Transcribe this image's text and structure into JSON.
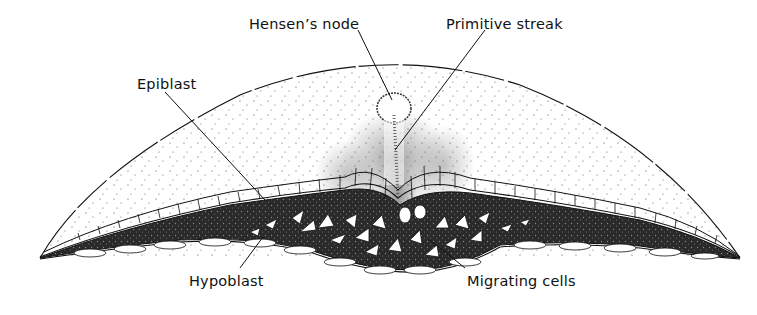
{
  "diagram": {
    "colors": {
      "ink": "#111111",
      "background": "#ffffff",
      "stipple": "#333333"
    },
    "labels": [
      {
        "id": "hensens-node",
        "text": "Hensen’s node",
        "x": 249,
        "y": 16
      },
      {
        "id": "primitive-streak",
        "text": "Primitive streak",
        "x": 446,
        "y": 16
      },
      {
        "id": "epiblast",
        "text": "Epiblast",
        "x": 137,
        "y": 76
      },
      {
        "id": "hypoblast",
        "text": "Hypoblast",
        "x": 189,
        "y": 273
      },
      {
        "id": "migrating-cells",
        "text": "Migrating cells",
        "x": 467,
        "y": 273
      }
    ]
  }
}
